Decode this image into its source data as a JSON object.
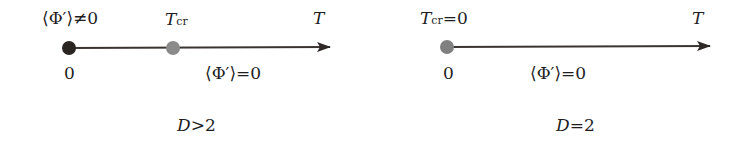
{
  "panels": [
    {
      "caption": "D>2",
      "caption_var": "D",
      "caption_rel": ">2",
      "axis_label": "T",
      "points": [
        {
          "position": "0",
          "label": "⟨Φ′⟩≠0",
          "color": "#2a2422"
        },
        {
          "position": "",
          "label_var": "T",
          "label_sub": "cr",
          "color": "#8a8a8a"
        }
      ],
      "region_label": "⟨Φ′⟩=0"
    },
    {
      "caption": "D=2",
      "caption_var": "D",
      "caption_rel": "=2",
      "axis_label": "T",
      "points": [
        {
          "position": "0",
          "label_var": "T",
          "label_sub": "cr",
          "label_rel": "=0",
          "color": "#808080"
        }
      ],
      "region_label": "⟨Φ′⟩=0"
    }
  ],
  "colors": {
    "line": "#3a3431",
    "dot_dark": "#2a2422",
    "dot_grey": "#858585"
  }
}
